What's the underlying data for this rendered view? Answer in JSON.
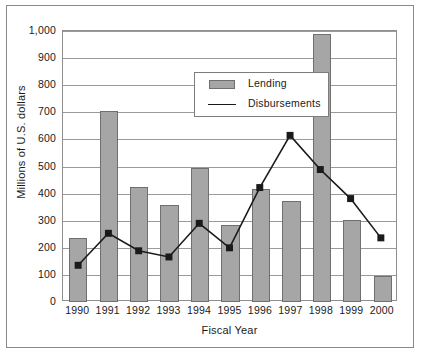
{
  "chart_data": {
    "type": "bar",
    "title": "",
    "xlabel": "Fiscal Year",
    "ylabel": "Millions of U.S. dollars",
    "categories": [
      "1990",
      "1991",
      "1992",
      "1993",
      "1994",
      "1995",
      "1996",
      "1997",
      "1998",
      "1999",
      "2000"
    ],
    "ylim": [
      0,
      1000
    ],
    "yticks": [
      0,
      100,
      200,
      300,
      400,
      500,
      600,
      700,
      800,
      900,
      1000
    ],
    "ytick_labels": [
      "0",
      "100",
      "200",
      "300",
      "400",
      "500",
      "600",
      "700",
      "800",
      "900",
      "1,000"
    ],
    "grid": true,
    "legend_position": "upper-left-inside",
    "series": [
      {
        "name": "Lending",
        "type": "bar",
        "color": "#a6a6a6",
        "values": [
          236,
          705,
          424,
          358,
          494,
          285,
          417,
          373,
          988,
          303,
          96
        ]
      },
      {
        "name": "Disbursements",
        "type": "line",
        "color": "#1a1a1a",
        "marker": "square",
        "values": [
          129,
          248,
          183,
          160,
          285,
          194,
          418,
          612,
          485,
          377,
          231
        ]
      }
    ]
  },
  "legend": {
    "items": [
      {
        "label": "Lending",
        "swatch": "bar-swatch"
      },
      {
        "label": "Disbursements",
        "swatch": "line-swatch"
      }
    ]
  },
  "axes": {
    "y_title": "Millions of U.S. dollars",
    "x_title": "Fiscal Year"
  }
}
